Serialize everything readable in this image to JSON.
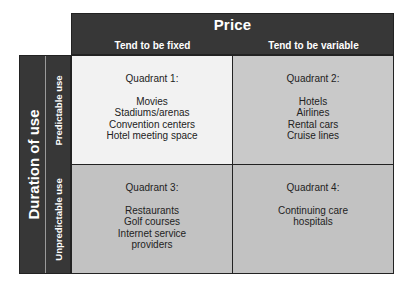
{
  "price_header": {
    "title": "Price",
    "columns": [
      "Tend to be fixed",
      "Tend to be variable"
    ]
  },
  "duration_header": {
    "title": "Duration of use",
    "rows": [
      "Predictable use",
      "Unpredictable use"
    ]
  },
  "quadrants": [
    {
      "title": "Quadrant 1:",
      "items": [
        "Movies",
        "Stadiums/arenas",
        "Convention centers",
        "Hotel meeting space"
      ]
    },
    {
      "title": "Quadrant 2:",
      "items": [
        "Hotels",
        "Airlines",
        "Rental cars",
        "Cruise lines"
      ]
    },
    {
      "title": "Quadrant 3:",
      "items": [
        "Restaurants",
        "Golf courses",
        "Internet service",
        "providers"
      ]
    },
    {
      "title": "Quadrant 4:",
      "items": [
        "Continuing care",
        "hospitals"
      ]
    }
  ],
  "colors": {
    "header_bg": "#373737",
    "quadrant1_bg": "#f2f2f2",
    "quadrant2_bg": "#c9c9c9",
    "quadrant3_bg": "#c2c2c2",
    "quadrant4_bg": "#c2c2c2"
  }
}
